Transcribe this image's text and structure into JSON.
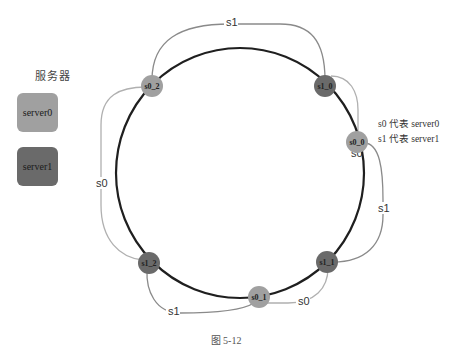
{
  "legend": {
    "title": "服务器",
    "items": [
      {
        "id": "s0",
        "label": "server0",
        "color": "#a0a0a0"
      },
      {
        "id": "s1",
        "label": "server1",
        "color": "#6a6a6a"
      }
    ]
  },
  "notes": [
    "s0 代表 server0",
    "s1 代表 server1"
  ],
  "caption": "图 5-12",
  "ring": {
    "color": "#1f1f1f"
  },
  "nodes": [
    {
      "label": "s0_2",
      "server": "s0"
    },
    {
      "label": "s1_0",
      "server": "s1"
    },
    {
      "label": "s0_0",
      "server": "s0"
    },
    {
      "label": "s1_1",
      "server": "s1"
    },
    {
      "label": "s0_1",
      "server": "s0"
    },
    {
      "label": "s1_2",
      "server": "s1"
    }
  ],
  "arcs": [
    {
      "from": "s0_2",
      "to": "s1_0",
      "label": "s1"
    },
    {
      "from": "s1_0",
      "to": "s0_0",
      "label": "s0"
    },
    {
      "from": "s0_0",
      "to": "s1_1",
      "label": "s1"
    },
    {
      "from": "s1_1",
      "to": "s0_1",
      "label": "s0"
    },
    {
      "from": "s0_1",
      "to": "s1_2",
      "label": "s1"
    },
    {
      "from": "s1_2",
      "to": "s0_2",
      "label": "s0"
    }
  ]
}
